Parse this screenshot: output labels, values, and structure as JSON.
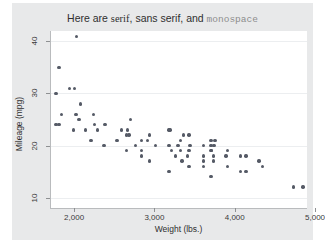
{
  "chart_data": {
    "type": "scatter",
    "title": "Here are serif, sans serif, and monospace",
    "title_parts": [
      {
        "text": "Here are ",
        "font": "sans"
      },
      {
        "text": "serif",
        "font": "serif"
      },
      {
        "text": ", ",
        "font": "sans"
      },
      {
        "text": "sans serif",
        "font": "sans"
      },
      {
        "text": ", and ",
        "font": "sans"
      },
      {
        "text": "monospace",
        "font": "mono"
      }
    ],
    "xlabel": "Weight (lbs.)",
    "ylabel": "Mileage (mpg)",
    "xlim": [
      1700,
      4900
    ],
    "ylim": [
      8,
      42
    ],
    "xticks": [
      2000,
      3000,
      4000,
      5000
    ],
    "xticklabels": [
      "2,000",
      "3,000",
      "4,000",
      "5,000"
    ],
    "yticks": [
      10,
      20,
      30,
      40
    ],
    "yticklabels": [
      "10",
      "20",
      "30",
      "40"
    ],
    "grid": "horizontal",
    "legend": "none",
    "marker_color": "#555a66",
    "background_color": "#e8e9ea",
    "plot_background_color": "#ffffff",
    "points": [
      {
        "x": 2020,
        "y": 41
      },
      {
        "x": 1800,
        "y": 35
      },
      {
        "x": 1930,
        "y": 31
      },
      {
        "x": 1990,
        "y": 31
      },
      {
        "x": 1760,
        "y": 30
      },
      {
        "x": 2070,
        "y": 28
      },
      {
        "x": 1830,
        "y": 26
      },
      {
        "x": 2010,
        "y": 26
      },
      {
        "x": 2230,
        "y": 26
      },
      {
        "x": 2050,
        "y": 25
      },
      {
        "x": 1760,
        "y": 24
      },
      {
        "x": 1800,
        "y": 24
      },
      {
        "x": 2690,
        "y": 25
      },
      {
        "x": 2240,
        "y": 24
      },
      {
        "x": 2370,
        "y": 24
      },
      {
        "x": 1980,
        "y": 23
      },
      {
        "x": 2130,
        "y": 23
      },
      {
        "x": 2280,
        "y": 23
      },
      {
        "x": 2580,
        "y": 23
      },
      {
        "x": 2650,
        "y": 23
      },
      {
        "x": 3170,
        "y": 23
      },
      {
        "x": 3180,
        "y": 23
      },
      {
        "x": 2930,
        "y": 22
      },
      {
        "x": 2670,
        "y": 22
      },
      {
        "x": 2640,
        "y": 22
      },
      {
        "x": 3350,
        "y": 22
      },
      {
        "x": 3420,
        "y": 22
      },
      {
        "x": 2200,
        "y": 21
      },
      {
        "x": 2520,
        "y": 21
      },
      {
        "x": 2830,
        "y": 21
      },
      {
        "x": 2900,
        "y": 21
      },
      {
        "x": 3310,
        "y": 21
      },
      {
        "x": 3690,
        "y": 21
      },
      {
        "x": 3740,
        "y": 21
      },
      {
        "x": 2360,
        "y": 20
      },
      {
        "x": 2750,
        "y": 20
      },
      {
        "x": 3000,
        "y": 20
      },
      {
        "x": 3170,
        "y": 20
      },
      {
        "x": 3280,
        "y": 20
      },
      {
        "x": 3430,
        "y": 20
      },
      {
        "x": 3600,
        "y": 20
      },
      {
        "x": 3690,
        "y": 20
      },
      {
        "x": 3730,
        "y": 20
      },
      {
        "x": 2640,
        "y": 19
      },
      {
        "x": 2830,
        "y": 19
      },
      {
        "x": 3200,
        "y": 19
      },
      {
        "x": 3310,
        "y": 19
      },
      {
        "x": 3420,
        "y": 19
      },
      {
        "x": 3690,
        "y": 19
      },
      {
        "x": 3700,
        "y": 19
      },
      {
        "x": 3900,
        "y": 19
      },
      {
        "x": 2830,
        "y": 18
      },
      {
        "x": 3250,
        "y": 18
      },
      {
        "x": 3400,
        "y": 18
      },
      {
        "x": 3600,
        "y": 18
      },
      {
        "x": 3720,
        "y": 18
      },
      {
        "x": 3880,
        "y": 18
      },
      {
        "x": 4060,
        "y": 18
      },
      {
        "x": 4130,
        "y": 18
      },
      {
        "x": 2930,
        "y": 17
      },
      {
        "x": 3330,
        "y": 17
      },
      {
        "x": 3600,
        "y": 17
      },
      {
        "x": 3720,
        "y": 17
      },
      {
        "x": 4290,
        "y": 17
      },
      {
        "x": 3420,
        "y": 16
      },
      {
        "x": 3600,
        "y": 16
      },
      {
        "x": 3900,
        "y": 16
      },
      {
        "x": 4330,
        "y": 16
      },
      {
        "x": 3170,
        "y": 15
      },
      {
        "x": 4060,
        "y": 15
      },
      {
        "x": 4130,
        "y": 15
      },
      {
        "x": 3690,
        "y": 14
      },
      {
        "x": 4720,
        "y": 12
      },
      {
        "x": 4840,
        "y": 12
      }
    ]
  }
}
